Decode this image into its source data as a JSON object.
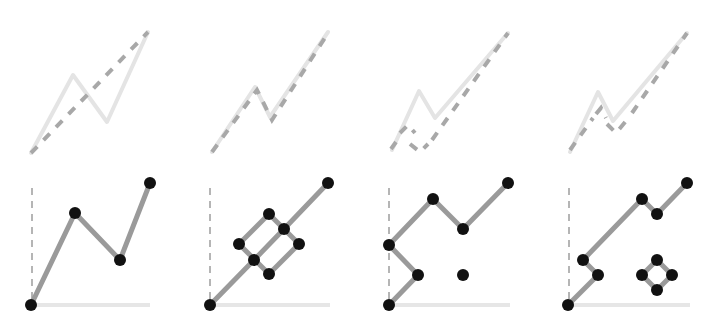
{
  "colors": {
    "background": "#ffffff",
    "node": "#111111",
    "edge": "#9a9a9a",
    "dashed_path": "#a8a8a8",
    "faint_path": "#e4e4e4",
    "axis_dash": "#b5b5b5",
    "baseline": "#e6e6e6"
  },
  "panels": [
    {
      "id": "panel-1",
      "top": {
        "faint_path": [
          [
            31,
            153
          ],
          [
            73,
            75
          ],
          [
            107,
            122
          ],
          [
            148,
            32
          ]
        ],
        "dashed_paths": [
          [
            [
              31,
              153
            ],
            [
              148,
              32
            ]
          ]
        ]
      },
      "bottom": {
        "axis": {
          "x": 32,
          "y1": 188,
          "y2": 300,
          "base_x1": 35,
          "base_x2": 150,
          "base_y": 305
        },
        "edges": [
          [
            [
              31,
              305
            ],
            [
              75,
              213
            ]
          ],
          [
            [
              75,
              213
            ],
            [
              120,
              260
            ]
          ],
          [
            [
              120,
              260
            ],
            [
              150,
              183
            ]
          ]
        ],
        "nodes": [
          [
            31,
            305
          ],
          [
            75,
            213
          ],
          [
            120,
            260
          ],
          [
            150,
            183
          ]
        ]
      }
    },
    {
      "id": "panel-2",
      "top": {
        "faint_path": [
          [
            212,
            152
          ],
          [
            255,
            87
          ],
          [
            270,
            117
          ],
          [
            328,
            32
          ]
        ],
        "dashed_paths": [
          [
            [
              212,
              152
            ],
            [
              257,
              90
            ],
            [
              272,
              120
            ],
            [
              328,
              33
            ]
          ]
        ]
      },
      "bottom": {
        "axis": {
          "x": 210,
          "y1": 188,
          "y2": 300,
          "base_x1": 214,
          "base_x2": 330,
          "base_y": 305
        },
        "edges": [
          [
            [
              210,
              305
            ],
            [
              254,
              260
            ]
          ],
          [
            [
              254,
              260
            ],
            [
              284,
              229
            ]
          ],
          [
            [
              284,
              229
            ],
            [
              328,
              183
            ]
          ],
          [
            [
              239,
              244
            ],
            [
              269,
              214
            ]
          ],
          [
            [
              269,
              214
            ],
            [
              299,
              244
            ]
          ],
          [
            [
              299,
              244
            ],
            [
              269,
              274
            ]
          ],
          [
            [
              269,
              274
            ],
            [
              239,
              244
            ]
          ]
        ],
        "nodes": [
          [
            210,
            305
          ],
          [
            254,
            260
          ],
          [
            284,
            229
          ],
          [
            328,
            183
          ],
          [
            239,
            244
          ],
          [
            269,
            214
          ],
          [
            299,
            244
          ],
          [
            269,
            274
          ]
        ]
      }
    },
    {
      "id": "panel-3",
      "top": {
        "faint_path": [
          [
            392,
            150
          ],
          [
            419,
            91
          ],
          [
            435,
            118
          ],
          [
            508,
            33
          ]
        ],
        "dashed_paths": [
          [
            [
              400,
              133
            ],
            [
              408,
              125
            ],
            [
              415,
              133
            ]
          ],
          [
            [
              410,
              144
            ],
            [
              420,
              152
            ],
            [
              428,
              144
            ]
          ],
          [
            [
              432,
              140
            ],
            [
              508,
              33
            ]
          ],
          [
            [
              391,
              149
            ],
            [
              396,
              142
            ]
          ]
        ]
      },
      "bottom": {
        "axis": {
          "x": 389,
          "y1": 188,
          "y2": 300,
          "base_x1": 393,
          "base_x2": 510,
          "base_y": 305
        },
        "edges": [
          [
            [
              389,
              305
            ],
            [
              418,
              275
            ]
          ],
          [
            [
              418,
              275
            ],
            [
              389,
              245
            ]
          ],
          [
            [
              389,
              245
            ],
            [
              433,
              199
            ]
          ],
          [
            [
              433,
              199
            ],
            [
              463,
              229
            ]
          ],
          [
            [
              463,
              229
            ],
            [
              508,
              183
            ]
          ]
        ],
        "nodes": [
          [
            389,
            305
          ],
          [
            418,
            275
          ],
          [
            389,
            245
          ],
          [
            433,
            199
          ],
          [
            463,
            229
          ],
          [
            508,
            183
          ],
          [
            463,
            275
          ]
        ]
      }
    },
    {
      "id": "panel-4",
      "top": {
        "faint_path": [
          [
            570,
            152
          ],
          [
            598,
            92
          ],
          [
            613,
            121
          ],
          [
            687,
            33
          ]
        ],
        "dashed_paths": [
          [
            [
              570,
              150
            ],
            [
              593,
              118
            ]
          ],
          [
            [
              596,
              114
            ],
            [
              601,
              108
            ],
            [
              606,
              118
            ]
          ],
          [
            [
              607,
              124
            ],
            [
              616,
              133
            ],
            [
              626,
              121
            ]
          ],
          [
            [
              632,
              113
            ],
            [
              687,
              33
            ]
          ]
        ]
      },
      "bottom": {
        "axis": {
          "x": 569,
          "y1": 188,
          "y2": 300,
          "base_x1": 573,
          "base_x2": 690,
          "base_y": 305
        },
        "edges": [
          [
            [
              568,
              305
            ],
            [
              598,
              275
            ]
          ],
          [
            [
              598,
              275
            ],
            [
              583,
              260
            ]
          ],
          [
            [
              583,
              260
            ],
            [
              642,
              199
            ]
          ],
          [
            [
              642,
              199
            ],
            [
              657,
              214
            ]
          ],
          [
            [
              657,
              214
            ],
            [
              687,
              183
            ]
          ],
          [
            [
              642,
              275
            ],
            [
              657,
              260
            ]
          ],
          [
            [
              657,
              260
            ],
            [
              672,
              275
            ]
          ],
          [
            [
              672,
              275
            ],
            [
              657,
              290
            ]
          ],
          [
            [
              657,
              290
            ],
            [
              642,
              275
            ]
          ]
        ],
        "nodes": [
          [
            568,
            305
          ],
          [
            598,
            275
          ],
          [
            583,
            260
          ],
          [
            642,
            199
          ],
          [
            657,
            214
          ],
          [
            687,
            183
          ],
          [
            642,
            275
          ],
          [
            657,
            260
          ],
          [
            672,
            275
          ],
          [
            657,
            290
          ]
        ]
      }
    }
  ]
}
